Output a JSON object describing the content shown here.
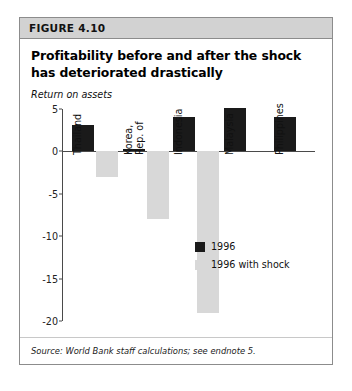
{
  "figure": {
    "label": "FIGURE 4.10",
    "title": "Profitability before and after the shock has deteriorated drastically",
    "source": "Source: World Bank staff calculations; see endnote 5."
  },
  "chart_data": {
    "type": "bar",
    "title": "Profitability before and after the shock has deteriorated drastically",
    "subtitle": "FIGURE 4.10",
    "xlabel": "",
    "ylabel": "Return on assets",
    "ylim": [
      -20,
      5
    ],
    "yticks": [
      "5",
      "0",
      "-5",
      "-10",
      "-15",
      "-20"
    ],
    "ytick_values": [
      5,
      0,
      -5,
      -10,
      -15,
      -20
    ],
    "grid": false,
    "legend_position": "inside-right",
    "categories": [
      "Thailand",
      "Korea, Rep. of",
      "Indonesia",
      "Malaysia",
      "Philippines"
    ],
    "series": [
      {
        "name": "1996",
        "color": "#1a1a1a",
        "values": [
          3.1,
          0.3,
          4.1,
          5.1,
          4.1
        ]
      },
      {
        "name": "1996 with shock",
        "color": "#d8d8d8",
        "values": [
          -3.0,
          -8.0,
          -19.0,
          null,
          null
        ]
      }
    ],
    "source": "Source: World Bank staff calculations; see endnote 5."
  }
}
